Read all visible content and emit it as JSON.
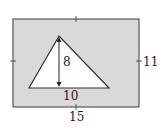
{
  "diagram": {
    "rectangle": {
      "width_label": "15",
      "height_label": "11",
      "fill": "#d9d9d9",
      "stroke": "#555555"
    },
    "triangle": {
      "base_label": "10",
      "height_label": "8",
      "fill": "#ffffff",
      "stroke": "#333333"
    }
  }
}
